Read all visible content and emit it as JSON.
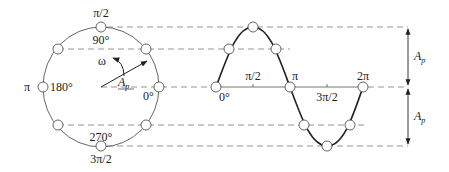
{
  "circle": {
    "labels": {
      "top_radian": "π/2",
      "top_degree": "90°",
      "left_radian": "π",
      "left_degree": "180°",
      "right_degree": "0°",
      "bottom_degree": "270°",
      "bottom_radian": "3π/2",
      "omega": "ω",
      "radius_main": "A",
      "radius_sub": "p"
    }
  },
  "wave": {
    "labels": {
      "origin": "0°",
      "half_pi": "π/2",
      "pi": "π",
      "three_half_pi": "3π/2",
      "two_pi": "2π"
    }
  },
  "amplitude": {
    "upper_main": "A",
    "upper_sub": "p",
    "lower_main": "A",
    "lower_sub": "p"
  },
  "colors": {
    "line": "#555555",
    "curve": "#222222",
    "dash": "#888888"
  }
}
